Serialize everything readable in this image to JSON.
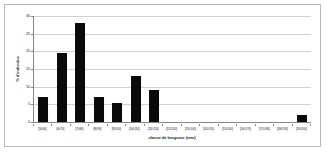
{
  "chart_data": {
    "type": "bar",
    "title": "",
    "subtitle": "",
    "xlabel": "classe de longueur (mm)",
    "ylabel": "% d'individus",
    "categories": [
      "[50;60]",
      "[60;70]",
      "[70;80]",
      "[80;90]",
      "[90;100]",
      "[100;110]",
      "[110;120]",
      "[120;130]",
      "[130;140]",
      "[140;150]",
      "[150;160]",
      "[160;170]",
      "[170;180]",
      "[180;190]",
      "[190;200]"
    ],
    "values": [
      7,
      19.5,
      28,
      7,
      5.3,
      13,
      9,
      0,
      0,
      0,
      0,
      0,
      0,
      0,
      2
    ],
    "ylim": [
      0,
      30
    ],
    "yticks": [
      0,
      5,
      10,
      15,
      20,
      25,
      30
    ],
    "ytick_labels": [
      "0",
      "5",
      "10",
      "15",
      "20",
      "25",
      "30"
    ],
    "grid": true,
    "legend": false,
    "legend_position": "none",
    "bar_color": "#0a0a0a",
    "gridline_color": "#d2d2d2",
    "axis_color": "#868686",
    "border_color": "#b9b9b9",
    "background_color": "#ffffff"
  }
}
